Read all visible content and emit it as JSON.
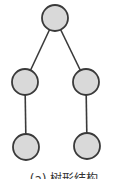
{
  "diagram": {
    "type": "tree",
    "colors": {
      "node_fill": "#d9d9d9",
      "node_stroke": "#3a3a3a",
      "edge": "#3a3a3a"
    },
    "nodes": [
      {
        "id": "root",
        "level": 0,
        "label": ""
      },
      {
        "id": "left-child",
        "level": 1,
        "label": ""
      },
      {
        "id": "right-child",
        "level": 1,
        "label": ""
      },
      {
        "id": "left-grandchild",
        "level": 2,
        "label": ""
      },
      {
        "id": "right-grandchild",
        "level": 2,
        "label": ""
      }
    ],
    "edges": [
      {
        "from": "root",
        "to": "left-child"
      },
      {
        "from": "root",
        "to": "right-child"
      },
      {
        "from": "left-child",
        "to": "left-grandchild"
      },
      {
        "from": "right-child",
        "to": "right-grandchild"
      }
    ],
    "caption": "(a) 树形结构"
  }
}
